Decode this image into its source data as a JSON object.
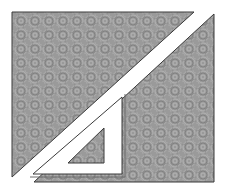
{
  "image": {
    "description": "Abstract geometric illustration: textured gray square split by a white diagonal stripe with a white set-square (triangle ruler) overlapping the lower right",
    "colors": {
      "background": "#ffffff",
      "fill": "#9a9a9a",
      "fill_light": "#b4b4b4",
      "fill_dark": "#7c7c7c",
      "outline": "#3a3a3a",
      "stripe": "#ffffff"
    },
    "shapes": {
      "frame": {
        "x": 12,
        "y": 12,
        "width": 202,
        "height": 170
      },
      "upper_left_triangle": "12,12 194,12 12,177",
      "right_region": "214,14 214,182 34,182 122,99",
      "set_square_outer": "122,97 122,174 33,174",
      "set_square_hole": "104,128 104,163 68,163"
    }
  }
}
